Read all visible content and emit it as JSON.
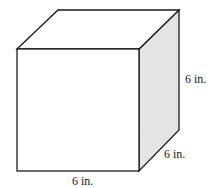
{
  "figure": {
    "shape": "cube",
    "colors": {
      "stroke": "#1a1a1a",
      "front_fill": "#ffffff",
      "top_fill": "#ffffff",
      "side_fill": "#e4e4e4",
      "background": "#ffffff"
    },
    "labels": {
      "height": "6 in.",
      "depth": "6 in.",
      "width": "6 in."
    }
  }
}
